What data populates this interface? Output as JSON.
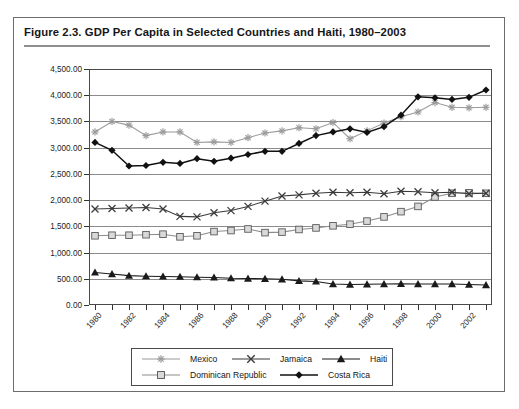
{
  "figure": {
    "title": "Figure 2.3.  GDP Per Capita in Selected Countries and Haiti, 1980–2003"
  },
  "chart_data": {
    "type": "line",
    "title": "GDP Per Capita in Selected Countries and Haiti, 1980–2003",
    "xlabel": "",
    "ylabel": "Constant 1995 USD",
    "ylim": [
      0,
      4500
    ],
    "ytick_labels": [
      "0.00",
      "500.00",
      "1,000.00",
      "1,500.00",
      "2,000.00",
      "2,500.00",
      "3,000.00",
      "3,500.00",
      "4,000.00",
      "4,500.00"
    ],
    "ytick_values": [
      0,
      500,
      1000,
      1500,
      2000,
      2500,
      3000,
      3500,
      4000,
      4500
    ],
    "grid": true,
    "legend_position": "bottom",
    "x": [
      1980,
      1981,
      1982,
      1983,
      1984,
      1985,
      1986,
      1987,
      1988,
      1989,
      1990,
      1991,
      1992,
      1993,
      1994,
      1995,
      1996,
      1997,
      1998,
      1999,
      2000,
      2001,
      2002,
      2003
    ],
    "xtick_labels": [
      "1980",
      "1982",
      "1984",
      "1986",
      "1988",
      "1990",
      "1992",
      "1994",
      "1996",
      "1998",
      "2000",
      "2002"
    ],
    "series": [
      {
        "name": "Mexico",
        "marker": "asterisk",
        "color": "#9a9a9a",
        "values": [
          3300,
          3500,
          3430,
          3230,
          3300,
          3300,
          3100,
          3110,
          3100,
          3190,
          3280,
          3320,
          3380,
          3360,
          3480,
          3170,
          3320,
          3470,
          3590,
          3680,
          3860,
          3770,
          3760,
          3770
        ]
      },
      {
        "name": "Jamaica",
        "marker": "cross",
        "color": "#3a3a3a",
        "values": [
          1830,
          1840,
          1850,
          1860,
          1830,
          1690,
          1680,
          1760,
          1800,
          1880,
          1980,
          2080,
          2100,
          2130,
          2150,
          2140,
          2150,
          2120,
          2170,
          2160,
          2140,
          2150,
          2120,
          2130
        ]
      },
      {
        "name": "Haiti",
        "marker": "triangle",
        "color": "#1a1a1a",
        "values": [
          620,
          590,
          560,
          550,
          545,
          540,
          530,
          525,
          510,
          505,
          500,
          490,
          460,
          450,
          400,
          390,
          395,
          400,
          405,
          400,
          400,
          400,
          390,
          380
        ]
      },
      {
        "name": "Dominican Republic",
        "marker": "square",
        "color": "#8c8c8c",
        "values": [
          1320,
          1330,
          1330,
          1340,
          1350,
          1300,
          1320,
          1400,
          1420,
          1450,
          1380,
          1390,
          1440,
          1470,
          1510,
          1540,
          1600,
          1680,
          1780,
          1880,
          2060,
          2130,
          2140,
          2130
        ]
      },
      {
        "name": "Costa Rica",
        "marker": "diamond",
        "color": "#111111",
        "values": [
          3100,
          2950,
          2650,
          2660,
          2720,
          2700,
          2790,
          2740,
          2800,
          2870,
          2930,
          2930,
          3080,
          3230,
          3300,
          3360,
          3290,
          3400,
          3620,
          3970,
          3950,
          3920,
          3960,
          4100
        ]
      }
    ]
  },
  "legend": {
    "items": [
      {
        "label": "Mexico"
      },
      {
        "label": "Jamaica"
      },
      {
        "label": "Haiti"
      },
      {
        "label": "Dominican Republic"
      },
      {
        "label": "Costa Rica"
      }
    ]
  }
}
